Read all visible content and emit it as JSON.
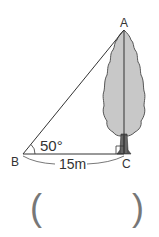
{
  "diagram": {
    "type": "right-triangle-tree-height",
    "points": {
      "A": {
        "label": "A"
      },
      "B": {
        "label": "B"
      },
      "C": {
        "label": "C"
      }
    },
    "angle_B": "50°",
    "distance_BC": "15m",
    "right_angle_at": "C",
    "answer_blank": {
      "open": "(",
      "close": ")"
    }
  },
  "colors": {
    "line": "#333333",
    "tree_fill": "#c8c8c8",
    "tree_outline": "#555555",
    "paren": "#777777"
  }
}
